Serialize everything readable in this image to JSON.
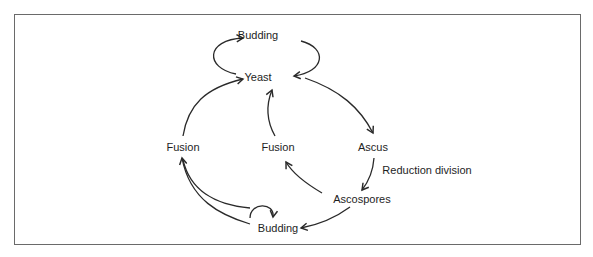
{
  "diagram": {
    "nodes": [
      {
        "id": "budding_top",
        "label": "Budding"
      },
      {
        "id": "yeast",
        "label": "Yeast"
      },
      {
        "id": "fusion_left",
        "label": "Fusion"
      },
      {
        "id": "fusion_middle",
        "label": "Fusion"
      },
      {
        "id": "ascus",
        "label": "Ascus"
      },
      {
        "id": "ascospores",
        "label": "Ascospores"
      },
      {
        "id": "budding_bottom",
        "label": "Budding"
      }
    ],
    "edge_labels": {
      "reduction_division": "Reduction division"
    },
    "edges": [
      {
        "from": "yeast",
        "to": "budding_top"
      },
      {
        "from": "budding_top",
        "to": "yeast"
      },
      {
        "from": "yeast",
        "to": "ascus"
      },
      {
        "from": "ascus",
        "to": "ascospores",
        "label": "Reduction division"
      },
      {
        "from": "ascospores",
        "to": "fusion_middle"
      },
      {
        "from": "fusion_middle",
        "to": "yeast"
      },
      {
        "from": "ascospores",
        "to": "budding_bottom"
      },
      {
        "from": "budding_bottom",
        "to": "budding_bottom"
      },
      {
        "from": "budding_bottom",
        "to": "fusion_left"
      },
      {
        "from": "fusion_left",
        "to": "yeast"
      }
    ],
    "stroke_color": "#2a2a2a"
  }
}
